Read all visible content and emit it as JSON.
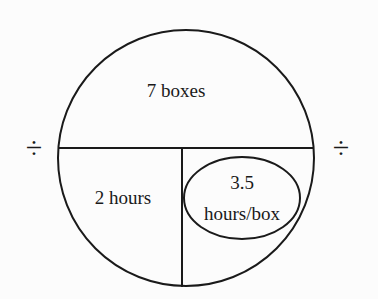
{
  "diagram": {
    "type": "triangle-circle-division",
    "top_label": "7 boxes",
    "bottom_left_label": "2 hours",
    "bottom_right_label_line1": "3.5",
    "bottom_right_label_line2": "hours/box",
    "left_operator": "÷",
    "right_operator": "÷",
    "colors": {
      "stroke": "#1a1a1a",
      "background": "#fcfcfc"
    }
  }
}
